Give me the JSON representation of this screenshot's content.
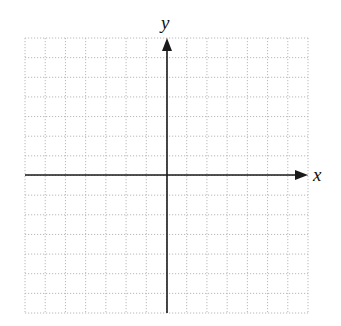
{
  "diagram": {
    "type": "coordinate-plane",
    "x_axis_label": "x",
    "y_axis_label": "y",
    "grid": {
      "columns": 14,
      "rows": 14,
      "style": "dotted",
      "color": "#b8b8b8"
    },
    "axis_color": "#1a1a1a",
    "origin_column_index": 7,
    "origin_row_index": 7
  }
}
